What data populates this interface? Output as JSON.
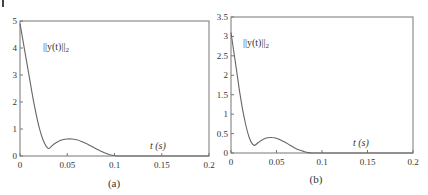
{
  "chart_data": [
    {
      "type": "line",
      "panel_label": "(a)",
      "title": "",
      "xlabel": "t (s)",
      "ylabel": "",
      "annotation": "||y(t)||2",
      "xlim": [
        0,
        0.2
      ],
      "ylim": [
        0,
        5
      ],
      "xticks": [
        "0",
        "0.05",
        "0.1",
        "0.15",
        "0.2"
      ],
      "yticks": [
        "0",
        "1",
        "2",
        "3",
        "4",
        "5"
      ],
      "grid": false,
      "series": [
        {
          "name": "||y(t)||2",
          "x": [
            0,
            0.005,
            0.01,
            0.015,
            0.02,
            0.025,
            0.03,
            0.035,
            0.04,
            0.045,
            0.05,
            0.055,
            0.06,
            0.065,
            0.07,
            0.075,
            0.08,
            0.085,
            0.09,
            0.095,
            0.1,
            0.105,
            0.12,
            0.15,
            0.2
          ],
          "values": [
            4.9,
            3.9,
            2.9,
            1.9,
            1.1,
            0.55,
            0.28,
            0.42,
            0.53,
            0.6,
            0.63,
            0.63,
            0.6,
            0.54,
            0.46,
            0.37,
            0.28,
            0.19,
            0.11,
            0.05,
            0.02,
            0.0,
            0.0,
            0.0,
            0.0
          ]
        }
      ]
    },
    {
      "type": "line",
      "panel_label": "(b)",
      "title": "",
      "xlabel": "t (s)",
      "ylabel": "",
      "annotation": "||y(t)||2",
      "xlim": [
        0,
        0.2
      ],
      "ylim": [
        0,
        3.5
      ],
      "xticks": [
        "0",
        "0.05",
        "0.1",
        "0.15",
        "0.2"
      ],
      "yticks": [
        "0",
        "0.5",
        "1",
        "1.5",
        "2",
        "2.5",
        "3",
        "3.5"
      ],
      "grid": false,
      "series": [
        {
          "name": "||y(t)||2",
          "x": [
            0,
            0.005,
            0.01,
            0.015,
            0.02,
            0.025,
            0.03,
            0.035,
            0.04,
            0.045,
            0.05,
            0.055,
            0.06,
            0.065,
            0.07,
            0.075,
            0.08,
            0.085,
            0.09,
            0.1,
            0.15,
            0.2
          ],
          "values": [
            3.1,
            2.3,
            1.5,
            0.85,
            0.4,
            0.2,
            0.27,
            0.35,
            0.39,
            0.4,
            0.38,
            0.33,
            0.27,
            0.2,
            0.13,
            0.08,
            0.04,
            0.01,
            0.0,
            0.0,
            0.0,
            0.0
          ]
        }
      ]
    }
  ],
  "panels": {
    "a": {
      "caption": "(a)",
      "annotation_main": "||y(t)||",
      "annotation_sub": "2",
      "xlabel": "t (s)",
      "xticks": [
        "0",
        "0.05",
        "0.1",
        "0.15",
        "0.2"
      ],
      "yticks": [
        "0",
        "1",
        "2",
        "3",
        "4",
        "5"
      ]
    },
    "b": {
      "caption": "(b)",
      "annotation_main": "||y(t)||",
      "annotation_sub": "2",
      "xlabel": "t (s)",
      "xticks": [
        "0",
        "0.05",
        "0.1",
        "0.15",
        "0.2"
      ],
      "yticks": [
        "0",
        "0.5",
        "1",
        "1.5",
        "2",
        "2.5",
        "3",
        "3.5"
      ]
    }
  }
}
